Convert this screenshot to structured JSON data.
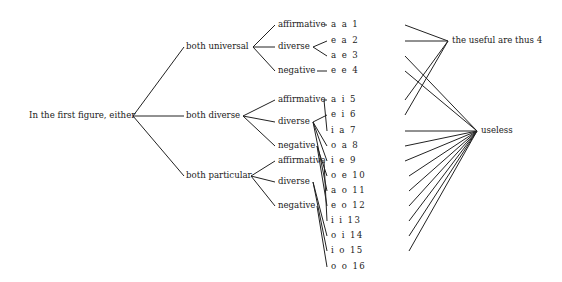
{
  "root": {
    "label": "In the first figure, either",
    "x": 29,
    "y": 116,
    "jx": 133
  },
  "level2": [
    {
      "id": "u",
      "label": "both universal",
      "x": 186,
      "y": 47,
      "jx": 253
    },
    {
      "id": "d",
      "label": "both diverse",
      "x": 186,
      "y": 116,
      "jx": 243
    },
    {
      "id": "p",
      "label": "both particular",
      "x": 186,
      "y": 176,
      "jx": 251
    }
  ],
  "level3": [
    {
      "id": "u_aff",
      "parent": 0,
      "label": "affirmative",
      "x": 278,
      "y": 25,
      "ex": 324
    },
    {
      "id": "u_div",
      "parent": 0,
      "label": "diverse",
      "x": 278,
      "y": 47,
      "ex": 313
    },
    {
      "id": "u_neg",
      "parent": 0,
      "label": "negative",
      "x": 278,
      "y": 71,
      "ex": 317
    },
    {
      "id": "d_aff",
      "parent": 1,
      "label": "affirmative",
      "x": 278,
      "y": 100,
      "ex": 324
    },
    {
      "id": "d_div",
      "parent": 1,
      "label": "diverse",
      "x": 278,
      "y": 122,
      "ex": 313
    },
    {
      "id": "d_neg",
      "parent": 1,
      "label": "negative",
      "x": 278,
      "y": 146,
      "ex": 317
    },
    {
      "id": "p_aff",
      "parent": 2,
      "label": "affirmative",
      "x": 278,
      "y": 161,
      "ex": 324
    },
    {
      "id": "p_div",
      "parent": 2,
      "label": "diverse",
      "x": 278,
      "y": 182,
      "ex": 313
    },
    {
      "id": "p_neg",
      "parent": 2,
      "label": "negative",
      "x": 278,
      "y": 206,
      "ex": 317
    }
  ],
  "moods": [
    {
      "label": "a a 1",
      "y": 25,
      "from": [
        0
      ],
      "to": "useful"
    },
    {
      "label": "e a 2",
      "y": 41,
      "from": [
        1
      ],
      "to": "useful"
    },
    {
      "label": "a e 3",
      "y": 56,
      "from": [
        1
      ],
      "to": "useless"
    },
    {
      "label": "e e 4",
      "y": 71,
      "from": [
        2
      ],
      "to": "useless"
    },
    {
      "label": "a i 5",
      "y": 100,
      "from": [
        3
      ],
      "to": "useful"
    },
    {
      "label": "e i 6",
      "y": 115,
      "from": [
        4
      ],
      "to": "useful"
    },
    {
      "label": "i a 7",
      "y": 131,
      "from": [
        3
      ],
      "to": "useless"
    },
    {
      "label": "o a 8",
      "y": 146,
      "from": [
        4
      ],
      "to": "useless"
    },
    {
      "label": "i e 9",
      "y": 161,
      "from": [
        4
      ],
      "to": "useless"
    },
    {
      "label": "o e 10",
      "y": 176,
      "from": [
        5
      ],
      "to": "useless"
    },
    {
      "label": "a o 11",
      "y": 191,
      "from": [
        4
      ],
      "to": "useless"
    },
    {
      "label": "e o 12",
      "y": 206,
      "from": [
        5
      ],
      "to": "useless"
    },
    {
      "label": "i i 13",
      "y": 221,
      "from": [
        6
      ],
      "to": "useless"
    },
    {
      "label": "o i 14",
      "y": 236,
      "from": [
        7
      ],
      "to": "useless"
    },
    {
      "label": "i o 15",
      "y": 251,
      "from": [
        7
      ],
      "to": "useless"
    },
    {
      "label": "o o 16",
      "y": 267,
      "from": [
        8
      ],
      "to": null
    }
  ],
  "mood_layout": {
    "x": 331,
    "in_x": 329,
    "out_x": 415
  },
  "outcomes": {
    "useful": {
      "label": "the useful are thus 4",
      "x": 452,
      "y": 41,
      "jx": 448
    },
    "useless": {
      "label": "useless",
      "x": 481,
      "y": 131,
      "jx": 477
    }
  }
}
